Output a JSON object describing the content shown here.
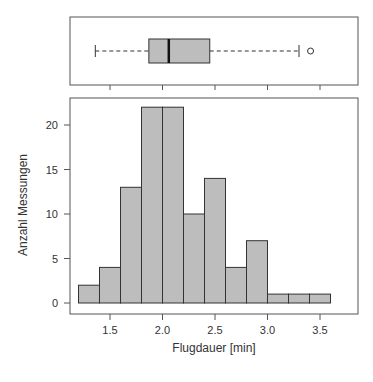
{
  "chart_data": [
    {
      "type": "boxplot",
      "title": "",
      "orientation": "horizontal",
      "stats": {
        "whisker_low": 1.36,
        "q1": 1.87,
        "median": 2.06,
        "q3": 2.45,
        "whisker_high": 3.3,
        "outliers": [
          3.41
        ]
      },
      "xlim": [
        1.1,
        3.85
      ],
      "x_ticks": [
        1.5,
        2.0,
        2.5,
        3.0,
        3.5
      ],
      "box_fill": "#bdbdbd"
    },
    {
      "type": "bar",
      "subtype": "histogram",
      "title": "",
      "xlabel": "Flugdauer [min]",
      "ylabel": "Anzahl Messungen",
      "bin_edges": [
        1.2,
        1.4,
        1.6,
        1.8,
        2.0,
        2.2,
        2.4,
        2.6,
        2.8,
        3.0,
        3.2,
        3.4,
        3.6
      ],
      "categories": [
        "1.2-1.4",
        "1.4-1.6",
        "1.6-1.8",
        "1.8-2.0",
        "2.0-2.2",
        "2.2-2.4",
        "2.4-2.6",
        "2.6-2.8",
        "2.8-3.0",
        "3.0-3.2",
        "3.2-3.4",
        "3.4-3.6"
      ],
      "values": [
        2,
        4,
        13,
        22,
        22,
        10,
        14,
        4,
        7,
        1,
        1,
        1
      ],
      "x_ticks": [
        "1.5",
        "2.0",
        "2.5",
        "3.0",
        "3.5"
      ],
      "y_ticks": [
        "0",
        "5",
        "10",
        "15",
        "20"
      ],
      "ylim": [
        0,
        23
      ],
      "grid": false,
      "bar_fill": "#bdbdbd"
    }
  ],
  "labels": {
    "xlabel": "Flugdauer [min]",
    "ylabel": "Anzahl Messungen",
    "x_ticks": [
      "1.5",
      "2.0",
      "2.5",
      "3.0",
      "3.5"
    ],
    "y_ticks": [
      "0",
      "5",
      "10",
      "15",
      "20"
    ]
  }
}
